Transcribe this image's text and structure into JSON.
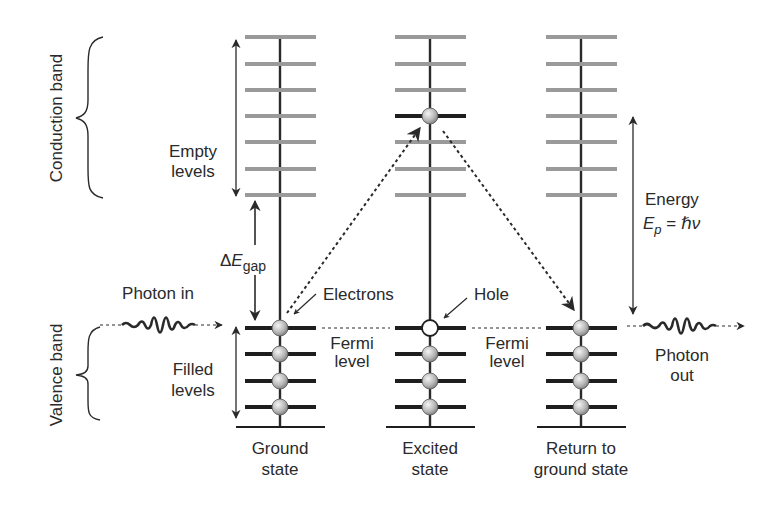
{
  "diagram": {
    "type": "semiconductor-band-diagram",
    "colors": {
      "background": "#ffffff",
      "empty_level": "#9a9a9a",
      "filled_level": "#1e1e1e",
      "axis_line": "#2a2a2a",
      "electron_fill_light": "#f2f2f2",
      "electron_fill_dark": "#8a8a8a",
      "hole_fill": "#ffffff",
      "text": "#2a2a2a"
    },
    "bands": {
      "conduction": {
        "label": "Conduction band"
      },
      "valence": {
        "label": "Valence band"
      }
    },
    "annotations": {
      "empty_levels_line1": "Empty",
      "empty_levels_line2": "levels",
      "filled_levels_line1": "Filled",
      "filled_levels_line2": "levels",
      "gap_delta": "Δ",
      "gap_E": "E",
      "gap_sub": "gap",
      "electrons": "Electrons",
      "hole": "Hole",
      "fermi_line1": "Fermi",
      "fermi_line2": "level",
      "photon_in": "Photon in",
      "photon_out_line1": "Photon",
      "photon_out_line2": "out",
      "energy_label": "Energy",
      "energy_E": "E",
      "energy_sub": "p",
      "energy_eq": " = ",
      "energy_hnu": "ℏν"
    },
    "columns": [
      {
        "id": "ground",
        "label_line1": "Ground",
        "label_line2": "state",
        "conduction_levels": 7,
        "occupied_conduction_level": null,
        "valence_levels": 4,
        "valence_occupancy": [
          "electron",
          "electron",
          "electron",
          "electron"
        ]
      },
      {
        "id": "excited",
        "label_line1": "Excited",
        "label_line2": "state",
        "conduction_levels": 7,
        "occupied_conduction_level": 4,
        "valence_levels": 4,
        "valence_occupancy": [
          "hole",
          "electron",
          "electron",
          "electron"
        ]
      },
      {
        "id": "return",
        "label_line1": "Return to",
        "label_line2": "ground state",
        "conduction_levels": 7,
        "occupied_conduction_level": null,
        "valence_levels": 4,
        "valence_occupancy": [
          "electron",
          "electron",
          "electron",
          "electron"
        ]
      }
    ],
    "transitions": [
      {
        "from": "ground valence top",
        "to": "excited conduction level 4",
        "style": "dotted",
        "direction": "up"
      },
      {
        "from": "excited conduction level 4",
        "to": "return valence top",
        "style": "dotted",
        "direction": "down"
      }
    ]
  }
}
